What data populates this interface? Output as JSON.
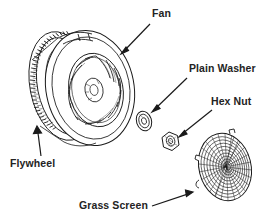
{
  "diagram": {
    "type": "exploded-parts-diagram",
    "background_color": "#ffffff",
    "line_color": "#1a1a1a",
    "text_color": "#232323",
    "labels": [
      {
        "id": "fan",
        "text": "Fan"
      },
      {
        "id": "washer",
        "text": "Plain Washer"
      },
      {
        "id": "hexnut",
        "text": "Hex Nut"
      },
      {
        "id": "flywheel",
        "text": "Flywheel"
      },
      {
        "id": "grass",
        "text": "Grass Screen"
      }
    ],
    "parts": [
      {
        "id": "flywheel-part",
        "name": "flywheel-with-ring-gear"
      },
      {
        "id": "fan-part",
        "name": "cooling-fan-blades"
      },
      {
        "id": "washer-part",
        "name": "plain-washer"
      },
      {
        "id": "hexnut-part",
        "name": "hex-nut"
      },
      {
        "id": "grass-part",
        "name": "grass-screen"
      }
    ],
    "leader_lines": [
      {
        "id": "fan",
        "from": [
          150,
          24
        ],
        "to": [
          121,
          54
        ]
      },
      {
        "id": "washer",
        "from": [
          187,
          78
        ],
        "to": [
          152,
          112
        ]
      },
      {
        "id": "hexnut",
        "from": [
          212,
          110
        ],
        "to": [
          179,
          137
        ]
      },
      {
        "id": "flywheel",
        "from": [
          40,
          156
        ],
        "to": [
          37,
          126
        ]
      },
      {
        "id": "grass",
        "from": [
          152,
          206
        ],
        "to": [
          193,
          192
        ]
      }
    ]
  }
}
